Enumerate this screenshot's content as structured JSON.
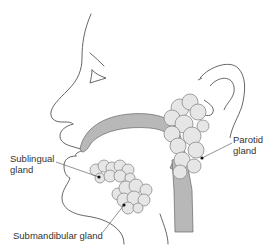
{
  "diagram": {
    "type": "anatomical-illustration",
    "labels": {
      "sublingual": [
        "Sublingual",
        "gland"
      ],
      "parotid": [
        "Parotid",
        "gland"
      ],
      "submandibular": "Submandibular gland"
    },
    "colors": {
      "outline": "#555555",
      "duct_fill": "#b8b8b8",
      "gland_fill": "#e6e6e6",
      "gland_stroke": "#8a8a8a",
      "text": "#333333",
      "marker": "#111111"
    }
  }
}
